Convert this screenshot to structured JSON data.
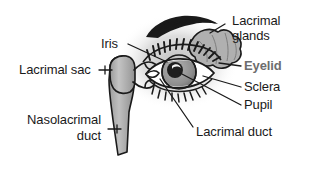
{
  "figure": {
    "type": "anatomical-diagram",
    "background_color": "#ffffff",
    "line_color": "#1a1a1a",
    "fill_gray": "#a8a8a8",
    "fill_light_gray": "#c9c9c9",
    "halo_gray": "#d9d9d9"
  },
  "labels": {
    "lacrimal_glands_line1": "Lacrimal",
    "lacrimal_glands_line2": "glands",
    "eyelid": "Eyelid",
    "sclera": "Sclera",
    "pupil": "Pupil",
    "iris": "Iris",
    "lacrimal_sac": "Lacrimal sac",
    "nasolacrimal_line1": "Nasolacrimal",
    "nasolacrimal_line2": "duct",
    "lacrimal_duct": "Lacrimal duct"
  },
  "colors": {
    "label_default": "#1a1a1a",
    "label_highlight": "#6d6d6d"
  }
}
